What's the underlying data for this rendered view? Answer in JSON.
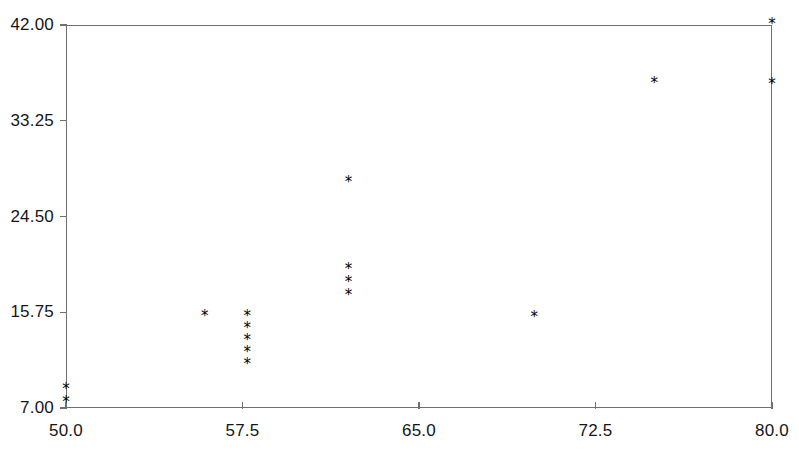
{
  "chart_data": {
    "type": "scatter",
    "title": "",
    "subtitle": "",
    "xlabel": "",
    "ylabel": "",
    "xlim": [
      50.0,
      80.0
    ],
    "ylim": [
      7.0,
      42.0
    ],
    "grid": false,
    "legend": null,
    "marker": "*",
    "marker_color": "#000000",
    "axis_color": "#6f6f6f",
    "xticks": [
      {
        "value": 50.0,
        "label": "50.0"
      },
      {
        "value": 57.5,
        "label": "57.5"
      },
      {
        "value": 65.0,
        "label": "65.0"
      },
      {
        "value": 72.5,
        "label": "72.5"
      },
      {
        "value": 80.0,
        "label": "80.0"
      }
    ],
    "yticks": [
      {
        "value": 7.0,
        "label": "7.00"
      },
      {
        "value": 15.75,
        "label": "15.75"
      },
      {
        "value": 24.5,
        "label": "24.50"
      },
      {
        "value": 33.25,
        "label": "33.25"
      },
      {
        "value": 42.0,
        "label": "42.00"
      }
    ],
    "points": [
      {
        "x": 50.0,
        "y": 8.6
      },
      {
        "x": 50.0,
        "y": 7.5
      },
      {
        "x": 55.9,
        "y": 15.3
      },
      {
        "x": 57.7,
        "y": 15.3
      },
      {
        "x": 57.7,
        "y": 14.2
      },
      {
        "x": 57.7,
        "y": 13.1
      },
      {
        "x": 57.7,
        "y": 12.0
      },
      {
        "x": 57.7,
        "y": 10.9
      },
      {
        "x": 62.0,
        "y": 27.6
      },
      {
        "x": 62.0,
        "y": 19.6
      },
      {
        "x": 62.0,
        "y": 18.4
      },
      {
        "x": 62.0,
        "y": 17.2
      },
      {
        "x": 69.9,
        "y": 15.2
      },
      {
        "x": 75.0,
        "y": 36.6
      },
      {
        "x": 80.0,
        "y": 36.5
      },
      {
        "x": 80.0,
        "y": 42.0
      }
    ]
  },
  "layout": {
    "plot_left_px": 66,
    "plot_right_px": 772,
    "plot_top_px": 25,
    "plot_bottom_px": 408,
    "tick_len_px": 7,
    "y_label_gap_px": 8,
    "x_label_offset_px": 14
  }
}
